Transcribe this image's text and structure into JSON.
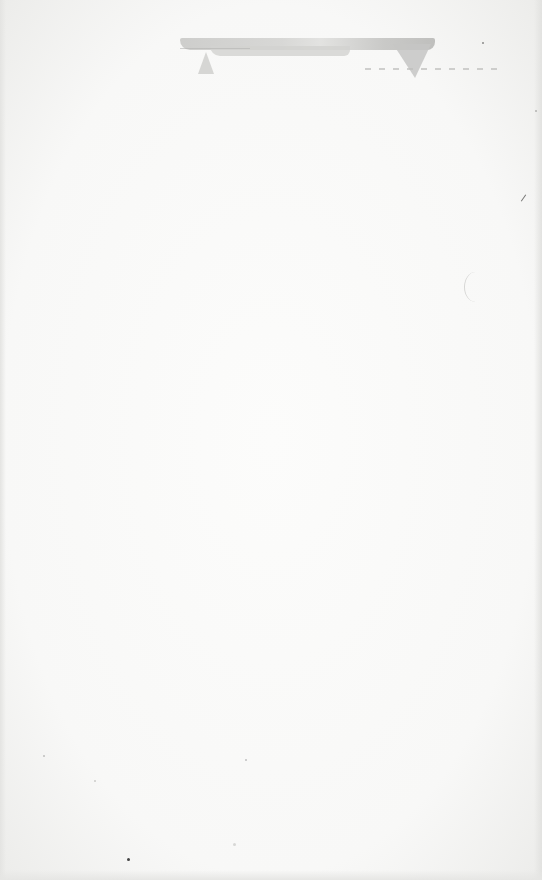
{
  "document": {
    "type": "blank scanned page",
    "visible_text": [],
    "colors": {
      "paper": "#f7f7f6",
      "smudge": "#c6c6c4",
      "speck": "#8a8a88"
    }
  }
}
